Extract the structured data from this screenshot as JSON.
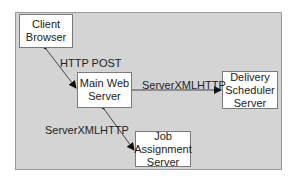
{
  "diagram": {
    "panel_color": "#d4d4d4",
    "nodes": [
      {
        "id": "client-browser",
        "lines": [
          "Client",
          "Browser"
        ]
      },
      {
        "id": "main-web-server",
        "lines": [
          "Main Web",
          "Server"
        ]
      },
      {
        "id": "delivery-scheduler-server",
        "lines": [
          "Delivery",
          "Scheduler",
          "Server"
        ]
      },
      {
        "id": "job-assignment-server",
        "lines": [
          "Job",
          "Assignment",
          "Server"
        ]
      }
    ],
    "edges": [
      {
        "from": "client-browser",
        "to": "main-web-server",
        "label": "HTTP POST",
        "direction": "bidirectional"
      },
      {
        "from": "main-web-server",
        "to": "delivery-scheduler-server",
        "label": "ServerXMLHTTP",
        "direction": "forward"
      },
      {
        "from": "main-web-server",
        "to": "job-assignment-server",
        "label": "ServerXMLHTTP",
        "direction": "bidirectional"
      }
    ]
  }
}
